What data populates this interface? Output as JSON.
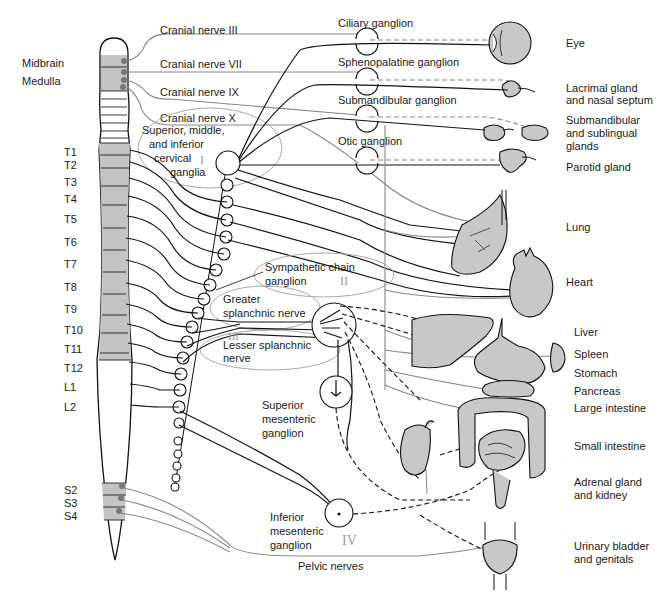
{
  "diagram": {
    "cns_labels": {
      "midbrain": "Midbrain",
      "medulla": "Medulla"
    },
    "spinal_segments": [
      "T1",
      "T2",
      "T3",
      "T4",
      "T5",
      "T6",
      "T7",
      "T8",
      "T9",
      "T10",
      "T11",
      "T12",
      "L1",
      "L2"
    ],
    "sacral_segments": [
      "S2",
      "S3",
      "S4"
    ],
    "cranial_nerves": [
      "Cranial nerve III",
      "Cranial nerve VII",
      "Cranial nerve IX",
      "Cranial nerve X"
    ],
    "ganglia": {
      "ciliary": "Ciliary ganglion",
      "sphenopalatine": "Sphenopalatine ganglion",
      "submandibular": "Submandibular ganglion",
      "otic": "Otic ganglion",
      "cervical_line1": "Superior, middle,",
      "cervical_line2": "and inferior",
      "cervical_line3": "cervical",
      "cervical_line4": "ganglia",
      "chain_line1": "Sympathetic chain",
      "chain_line2": "ganglion",
      "greater_line1": "Greater",
      "greater_line2": "splanchnic nerve",
      "lesser_line1": "Lesser splanchnic",
      "lesser_line2": "nerve",
      "sup_mes_line1": "Superior",
      "sup_mes_line2": "mesenteric",
      "sup_mes_line3": "ganglion",
      "inf_mes_line1": "Inferior",
      "inf_mes_line2": "mesenteric",
      "inf_mes_line3": "ganglion",
      "pelvic": "Pelvic nerves"
    },
    "organs": {
      "eye": "Eye",
      "lacrimal_1": "Lacrimal gland",
      "lacrimal_2": "and nasal septum",
      "submand_1": "Submandibular",
      "submand_2": "and sublingual",
      "submand_3": "glands",
      "parotid": "Parotid gland",
      "lung": "Lung",
      "heart": "Heart",
      "liver": "Liver",
      "spleen": "Spleen",
      "stomach": "Stomach",
      "pancreas": "Pancreas",
      "large_intestine": "Large intestine",
      "small_intestine": "Small intestine",
      "adrenal_1": "Adrenal gland",
      "adrenal_2": "and kidney",
      "bladder_1": "Urinary bladder",
      "bladder_2": "and genitals"
    },
    "roman_marks": [
      "I",
      "II",
      "III",
      "IV"
    ],
    "colors": {
      "organ_fill": "#c8c8c8",
      "sympathetic_line": "#111111",
      "parasympathetic_line": "#888888",
      "cord_fill": "#c4c4c4"
    }
  }
}
